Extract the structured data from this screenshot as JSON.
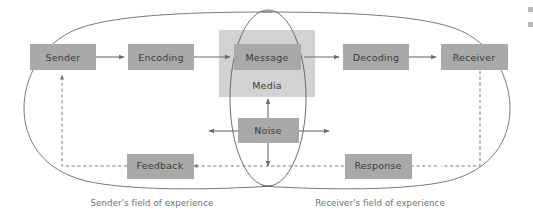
{
  "diagram": {
    "colors": {
      "box_fill": "#a9a9a9",
      "media_fill": "#d2d2d2",
      "outline": "#6a6a6a",
      "text": "#3b3b3b",
      "caption_text": "#6f6f6f",
      "dashed_line": "#7a7a7a"
    },
    "nodes": [
      {
        "id": "sender",
        "label": "Sender"
      },
      {
        "id": "encoding",
        "label": "Encoding"
      },
      {
        "id": "message",
        "label": "Message"
      },
      {
        "id": "decoding",
        "label": "Decoding"
      },
      {
        "id": "receiver",
        "label": "Receiver"
      },
      {
        "id": "noise",
        "label": "Noise"
      },
      {
        "id": "feedback",
        "label": "Feedback"
      },
      {
        "id": "response",
        "label": "Response"
      }
    ],
    "media_panel": {
      "id": "media",
      "label": "Media"
    },
    "captions": [
      {
        "id": "sender-field",
        "label": "Sender's field of experience"
      },
      {
        "id": "receiver-field",
        "label": "Receiver's field of experience"
      }
    ]
  }
}
